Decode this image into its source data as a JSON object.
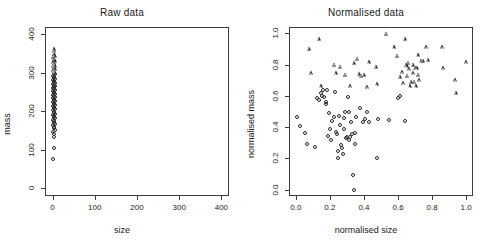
{
  "figure": {
    "width": 488,
    "height": 247,
    "background": "#ffffff",
    "point_color": "#2b2b2b",
    "axis_color": "#3d3d3d"
  },
  "chart_data": [
    {
      "type": "scatter",
      "title": "Raw data",
      "xlabel": "size",
      "ylabel": "mass",
      "xlim": [
        -18,
        418
      ],
      "ylim": [
        -20,
        418
      ],
      "xticks": [
        0,
        100,
        200,
        300,
        400
      ],
      "xticklabels": [
        "0",
        "100",
        "200",
        "300",
        "400"
      ],
      "yticks": [
        0,
        100,
        200,
        300,
        400
      ],
      "yticklabels": [
        "0",
        "100",
        "200",
        "300",
        "400"
      ],
      "grid": false,
      "legend": "none",
      "series": [
        {
          "name": "circles",
          "marker": "circle",
          "points": [
            [
              2,
              75
            ],
            [
              3,
              105
            ],
            [
              3,
              133
            ],
            [
              4,
              140
            ],
            [
              2,
              146
            ],
            [
              5,
              151
            ],
            [
              3,
              155
            ],
            [
              4,
              160
            ],
            [
              2,
              163
            ],
            [
              5,
              167
            ],
            [
              3,
              170
            ],
            [
              4,
              174
            ],
            [
              2,
              177
            ],
            [
              5,
              181
            ],
            [
              3,
              184
            ],
            [
              4,
              187
            ],
            [
              2,
              190
            ],
            [
              5,
              193
            ],
            [
              3,
              196
            ],
            [
              4,
              199
            ],
            [
              2,
              202
            ],
            [
              5,
              205
            ],
            [
              3,
              208
            ],
            [
              4,
              210
            ],
            [
              2,
              213
            ],
            [
              5,
              216
            ],
            [
              3,
              218
            ],
            [
              4,
              221
            ],
            [
              2,
              223
            ],
            [
              5,
              226
            ],
            [
              3,
              228
            ],
            [
              4,
              231
            ],
            [
              2,
              233
            ],
            [
              5,
              236
            ],
            [
              3,
              238
            ],
            [
              4,
              240
            ],
            [
              2,
              243
            ],
            [
              5,
              245
            ],
            [
              3,
              247
            ],
            [
              4,
              250
            ],
            [
              2,
              252
            ],
            [
              5,
              254
            ],
            [
              3,
              257
            ],
            [
              4,
              259
            ],
            [
              2,
              261
            ],
            [
              5,
              264
            ],
            [
              3,
              266
            ],
            [
              4,
              268
            ],
            [
              2,
              271
            ],
            [
              5,
              273
            ],
            [
              3,
              276
            ],
            [
              4,
              278
            ],
            [
              2,
              281
            ],
            [
              5,
              283
            ],
            [
              3,
              286
            ],
            [
              4,
              289
            ],
            [
              2,
              292
            ],
            [
              5,
              295
            ],
            [
              3,
              298
            ]
          ]
        },
        {
          "name": "triangles",
          "marker": "triangle",
          "points": [
            [
              3,
              300
            ],
            [
              4,
              303
            ],
            [
              2,
              306
            ],
            [
              5,
              308
            ],
            [
              3,
              311
            ],
            [
              4,
              313
            ],
            [
              2,
              316
            ],
            [
              5,
              318
            ],
            [
              3,
              321
            ],
            [
              4,
              324
            ],
            [
              2,
              327
            ],
            [
              5,
              330
            ],
            [
              3,
              333
            ],
            [
              4,
              336
            ],
            [
              2,
              340
            ],
            [
              5,
              344
            ],
            [
              3,
              349
            ],
            [
              4,
              355
            ],
            [
              3,
              360
            ]
          ]
        }
      ]
    },
    {
      "type": "scatter",
      "title": "Normalised data",
      "xlabel": "normalised size",
      "ylabel": "normalised mass",
      "xlim": [
        -0.04,
        1.04
      ],
      "ylim": [
        -0.04,
        1.04
      ],
      "xticks": [
        0.0,
        0.2,
        0.4,
        0.6,
        0.8,
        1.0
      ],
      "xticklabels": [
        "0.0",
        "0.2",
        "0.4",
        "0.6",
        "0.8",
        "1.0"
      ],
      "yticks": [
        0.0,
        0.2,
        0.4,
        0.6,
        0.8,
        1.0
      ],
      "yticklabels": [
        "0.0",
        "0.2",
        "0.4",
        "0.6",
        "0.8",
        "1.0"
      ],
      "grid": false,
      "legend": "none",
      "series": [
        {
          "name": "circles",
          "marker": "circle",
          "points": [
            [
              0.005,
              0.465
            ],
            [
              0.025,
              0.405
            ],
            [
              0.055,
              0.365
            ],
            [
              0.065,
              0.295
            ],
            [
              0.115,
              0.275
            ],
            [
              0.125,
              0.585
            ],
            [
              0.135,
              0.575
            ],
            [
              0.145,
              0.62
            ],
            [
              0.155,
              0.6
            ],
            [
              0.16,
              0.64
            ],
            [
              0.165,
              0.59
            ],
            [
              0.175,
              0.56
            ],
            [
              0.18,
              0.545
            ],
            [
              0.185,
              0.64
            ],
            [
              0.19,
              0.345
            ],
            [
              0.195,
              0.49
            ],
            [
              0.2,
              0.39
            ],
            [
              0.205,
              0.315
            ],
            [
              0.215,
              0.44
            ],
            [
              0.225,
              0.465
            ],
            [
              0.23,
              0.625
            ],
            [
              0.235,
              0.37
            ],
            [
              0.24,
              0.355
            ],
            [
              0.245,
              0.25
            ],
            [
              0.25,
              0.205
            ],
            [
              0.255,
              0.47
            ],
            [
              0.26,
              0.415
            ],
            [
              0.265,
              0.285
            ],
            [
              0.27,
              0.265
            ],
            [
              0.275,
              0.23
            ],
            [
              0.28,
              0.46
            ],
            [
              0.285,
              0.385
            ],
            [
              0.29,
              0.5
            ],
            [
              0.295,
              0.33
            ],
            [
              0.3,
              0.34
            ],
            [
              0.305,
              0.595
            ],
            [
              0.31,
              0.495
            ],
            [
              0.315,
              0.32
            ],
            [
              0.32,
              0.335
            ],
            [
              0.325,
              0.43
            ],
            [
              0.33,
              0.355
            ],
            [
              0.335,
              0.095
            ],
            [
              0.34,
              0.0
            ],
            [
              0.345,
              0.29
            ],
            [
              0.35,
              0.36
            ],
            [
              0.355,
              0.465
            ],
            [
              0.375,
              0.52
            ],
            [
              0.395,
              0.43
            ],
            [
              0.405,
              0.455
            ],
            [
              0.415,
              0.5
            ],
            [
              0.43,
              0.43
            ],
            [
              0.475,
              0.205
            ],
            [
              0.48,
              0.455
            ],
            [
              0.545,
              0.445
            ],
            [
              0.6,
              0.585
            ],
            [
              0.61,
              0.6
            ],
            [
              0.64,
              0.44
            ]
          ]
        },
        {
          "name": "triangles",
          "marker": "triangle",
          "points": [
            [
              0.075,
              0.9
            ],
            [
              0.09,
              0.745
            ],
            [
              0.135,
              0.965
            ],
            [
              0.145,
              0.66
            ],
            [
              0.225,
              0.8
            ],
            [
              0.235,
              0.745
            ],
            [
              0.26,
              0.785
            ],
            [
              0.29,
              0.735
            ],
            [
              0.32,
              0.66
            ],
            [
              0.34,
              0.81
            ],
            [
              0.36,
              0.835
            ],
            [
              0.37,
              0.74
            ],
            [
              0.385,
              0.73
            ],
            [
              0.4,
              0.735
            ],
            [
              0.42,
              0.655
            ],
            [
              0.43,
              0.815
            ],
            [
              0.47,
              0.785
            ],
            [
              0.475,
              0.675
            ],
            [
              0.53,
              0.995
            ],
            [
              0.575,
              0.91
            ],
            [
              0.595,
              0.855
            ],
            [
              0.61,
              0.72
            ],
            [
              0.625,
              0.75
            ],
            [
              0.63,
              0.68
            ],
            [
              0.64,
              0.965
            ],
            [
              0.645,
              0.8
            ],
            [
              0.65,
              0.79
            ],
            [
              0.655,
              0.73
            ],
            [
              0.66,
              0.81
            ],
            [
              0.665,
              0.77
            ],
            [
              0.67,
              0.66
            ],
            [
              0.675,
              0.69
            ],
            [
              0.685,
              0.8
            ],
            [
              0.69,
              0.745
            ],
            [
              0.695,
              0.69
            ],
            [
              0.7,
              0.78
            ],
            [
              0.705,
              0.66
            ],
            [
              0.71,
              0.775
            ],
            [
              0.715,
              0.86
            ],
            [
              0.72,
              0.735
            ],
            [
              0.725,
              0.7
            ],
            [
              0.735,
              0.82
            ],
            [
              0.745,
              0.825
            ],
            [
              0.765,
              0.91
            ],
            [
              0.775,
              0.83
            ],
            [
              0.86,
              0.91
            ],
            [
              0.865,
              0.775
            ],
            [
              0.935,
              0.7
            ],
            [
              0.94,
              0.62
            ],
            [
              1.0,
              0.815
            ]
          ]
        }
      ]
    }
  ]
}
